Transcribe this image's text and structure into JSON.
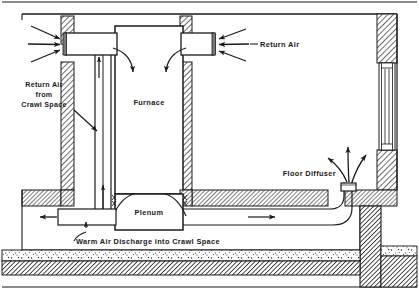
{
  "figure": {
    "type": "technical-cutaway-diagram"
  },
  "labels": {
    "return_air_crawl": {
      "line1": "Return Air",
      "line2": "from",
      "line3": "Crawl Space"
    },
    "furnace": "Furnace",
    "return_air": "Return Air",
    "plenum": "Plenum",
    "floor_diffuser": "Floor Diffuser",
    "warm_air_discharge": "Warm Air  Discharge  into Crawl  Space"
  },
  "components": [
    {
      "name": "furnace-cabinet",
      "label": "Furnace"
    },
    {
      "name": "plenum-box",
      "label": "Plenum"
    },
    {
      "name": "left-return-duct",
      "label": "Return Air from Crawl Space"
    },
    {
      "name": "right-return-grille",
      "label": "Return Air"
    },
    {
      "name": "floor-diffuser",
      "label": "Floor Diffuser"
    },
    {
      "name": "warm-air-discharge-duct",
      "label": "Warm Air Discharge into Crawl Space"
    },
    {
      "name": "crawl-space-cavity",
      "label": "Crawl Space"
    },
    {
      "name": "foundation-wall-left",
      "label": ""
    },
    {
      "name": "foundation-wall-right",
      "label": ""
    },
    {
      "name": "window-right-wall",
      "label": ""
    },
    {
      "name": "gravel-layer",
      "label": ""
    },
    {
      "name": "soil-layer",
      "label": ""
    }
  ],
  "colors": {
    "ink": "#1a1a1a",
    "paper": "#ffffff",
    "hatch": "#3a3a3a"
  },
  "arrows": {
    "left_return_inflow_count": 3,
    "right_return_inflow_count": 3,
    "diffuser_outflow_count": 3,
    "discharge_direction": "left",
    "supply_duct_direction": "right",
    "riser_direction": "up"
  }
}
